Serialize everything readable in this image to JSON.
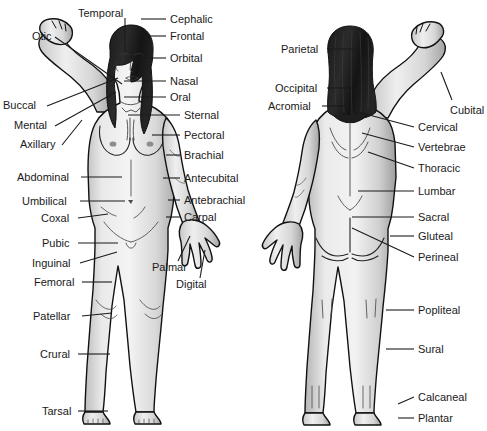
{
  "figure": {
    "views": [
      {
        "name": "anterior",
        "caption": ""
      },
      {
        "name": "posterior",
        "caption": ""
      }
    ],
    "colors": {
      "outline": "#111111",
      "skin_light": "#f2f2f2",
      "skin_mid": "#d4d4d4",
      "skin_shadow": "#a8a8a8",
      "hair": "#1b1b1b",
      "leader": "#1a1a1a",
      "text": "#1a1a1a",
      "background": "#ffffff"
    }
  },
  "anterior_labels_left": [
    {
      "text": "Temporal",
      "x": 78,
      "y": 8,
      "lx1": 125,
      "ly1": 18,
      "lx2": 125,
      "ly2": 52
    },
    {
      "text": "Otic",
      "x": 32,
      "y": 31,
      "lx1": 55,
      "ly1": 37,
      "lx2": 122,
      "ly2": 84
    },
    {
      "text": "Buccal",
      "x": 3,
      "y": 100,
      "lx1": 47,
      "ly1": 106,
      "lx2": 118,
      "ly2": 78
    },
    {
      "text": "Mental",
      "x": 14,
      "y": 120,
      "lx1": 55,
      "ly1": 126,
      "lx2": 116,
      "ly2": 92
    },
    {
      "text": "Axillary",
      "x": 20,
      "y": 139,
      "lx1": 62,
      "ly1": 145,
      "lx2": 82,
      "ly2": 120
    },
    {
      "text": "Abdominal",
      "x": 17,
      "y": 172,
      "lx1": 81,
      "ly1": 177,
      "lx2": 122,
      "ly2": 177
    },
    {
      "text": "Umbilical",
      "x": 22,
      "y": 196,
      "lx1": 80,
      "ly1": 201,
      "lx2": 125,
      "ly2": 201
    },
    {
      "text": "Coxal",
      "x": 41,
      "y": 213,
      "lx1": 78,
      "ly1": 218,
      "lx2": 108,
      "ly2": 214
    },
    {
      "text": "Pubic",
      "x": 42,
      "y": 238,
      "lx1": 78,
      "ly1": 243,
      "lx2": 118,
      "ly2": 243
    },
    {
      "text": "Inguinal",
      "x": 32,
      "y": 258,
      "lx1": 80,
      "ly1": 263,
      "lx2": 117,
      "ly2": 252
    },
    {
      "text": "Femoral",
      "x": 34,
      "y": 277,
      "lx1": 82,
      "ly1": 282,
      "lx2": 112,
      "ly2": 282
    },
    {
      "text": "Patellar",
      "x": 33,
      "y": 311,
      "lx1": 82,
      "ly1": 316,
      "lx2": 112,
      "ly2": 313
    },
    {
      "text": "Crural",
      "x": 40,
      "y": 349,
      "lx1": 78,
      "ly1": 354,
      "lx2": 110,
      "ly2": 354
    },
    {
      "text": "Tarsal",
      "x": 42,
      "y": 406,
      "lx1": 78,
      "ly1": 411,
      "lx2": 108,
      "ly2": 411
    }
  ],
  "anterior_labels_right": [
    {
      "text": "Cephalic",
      "x": 170,
      "y": 14,
      "lx1": 141,
      "ly1": 19,
      "lx2": 166,
      "ly2": 19
    },
    {
      "text": "Frontal",
      "x": 170,
      "y": 31,
      "lx1": 141,
      "ly1": 36,
      "lx2": 166,
      "ly2": 36
    },
    {
      "text": "Orbital",
      "x": 170,
      "y": 53,
      "lx1": 138,
      "ly1": 58,
      "lx2": 166,
      "ly2": 58
    },
    {
      "text": "Nasal",
      "x": 170,
      "y": 76,
      "lx1": 124,
      "ly1": 81,
      "lx2": 166,
      "ly2": 81
    },
    {
      "text": "Oral",
      "x": 170,
      "y": 92,
      "lx1": 124,
      "ly1": 97,
      "lx2": 166,
      "ly2": 97
    },
    {
      "text": "Sternal",
      "x": 184,
      "y": 110,
      "lx1": 128,
      "ly1": 115,
      "lx2": 180,
      "ly2": 115
    },
    {
      "text": "Pectoral",
      "x": 184,
      "y": 130,
      "lx1": 152,
      "ly1": 135,
      "lx2": 180,
      "ly2": 135
    },
    {
      "text": "Brachial",
      "x": 184,
      "y": 150,
      "lx1": 166,
      "ly1": 155,
      "lx2": 180,
      "ly2": 155
    },
    {
      "text": "Antecubital",
      "x": 184,
      "y": 173,
      "lx1": 163,
      "ly1": 178,
      "lx2": 180,
      "ly2": 178
    },
    {
      "text": "Antebrachial",
      "x": 184,
      "y": 195,
      "lx1": 168,
      "ly1": 200,
      "lx2": 180,
      "ly2": 200
    },
    {
      "text": "Carpal",
      "x": 184,
      "y": 212,
      "lx1": 166,
      "ly1": 217,
      "lx2": 180,
      "ly2": 217
    },
    {
      "text": "Palmar",
      "x": 152,
      "y": 262,
      "lx1": 178,
      "ly1": 261,
      "lx2": 190,
      "ly2": 236
    },
    {
      "text": "Digital",
      "x": 176,
      "y": 279,
      "lx1": 200,
      "ly1": 278,
      "lx2": 205,
      "ly2": 250
    }
  ],
  "posterior_labels_left": [
    {
      "text": "Parietal",
      "x": 281,
      "y": 44,
      "lx1": 327,
      "ly1": 49,
      "lx2": 354,
      "ly2": 49
    },
    {
      "text": "Occipital",
      "x": 275,
      "y": 83,
      "lx1": 327,
      "ly1": 88,
      "lx2": 352,
      "ly2": 88
    },
    {
      "text": "Acromial",
      "x": 268,
      "y": 101,
      "lx1": 322,
      "ly1": 106,
      "lx2": 348,
      "ly2": 106
    }
  ],
  "posterior_labels_right": [
    {
      "text": "Cubital",
      "x": 450,
      "y": 105,
      "lx1": 441,
      "ly1": 72,
      "lx2": 452,
      "ly2": 100
    },
    {
      "text": "Cervical",
      "x": 418,
      "y": 122,
      "lx1": 358,
      "ly1": 112,
      "lx2": 414,
      "ly2": 127
    },
    {
      "text": "Vertebrae",
      "x": 418,
      "y": 142,
      "lx1": 362,
      "ly1": 133,
      "lx2": 414,
      "ly2": 147
    },
    {
      "text": "Thoracic",
      "x": 418,
      "y": 163,
      "lx1": 368,
      "ly1": 152,
      "lx2": 414,
      "ly2": 168
    },
    {
      "text": "Lumbar",
      "x": 418,
      "y": 186,
      "lx1": 358,
      "ly1": 191,
      "lx2": 414,
      "ly2": 191
    },
    {
      "text": "Sacral",
      "x": 418,
      "y": 212,
      "lx1": 352,
      "ly1": 217,
      "lx2": 414,
      "ly2": 217
    },
    {
      "text": "Gluteal",
      "x": 418,
      "y": 231,
      "lx1": 390,
      "ly1": 236,
      "lx2": 414,
      "ly2": 236
    },
    {
      "text": "Perineal",
      "x": 418,
      "y": 252,
      "lx1": 352,
      "ly1": 228,
      "lx2": 414,
      "ly2": 257
    },
    {
      "text": "Popliteal",
      "x": 418,
      "y": 305,
      "lx1": 386,
      "ly1": 310,
      "lx2": 414,
      "ly2": 310
    },
    {
      "text": "Sural",
      "x": 418,
      "y": 344,
      "lx1": 386,
      "ly1": 349,
      "lx2": 414,
      "ly2": 349
    },
    {
      "text": "Calcaneal",
      "x": 418,
      "y": 392,
      "lx1": 398,
      "ly1": 404,
      "lx2": 414,
      "ly2": 397
    },
    {
      "text": "Plantar",
      "x": 418,
      "y": 413,
      "lx1": 398,
      "ly1": 418,
      "lx2": 414,
      "ly2": 418
    }
  ]
}
